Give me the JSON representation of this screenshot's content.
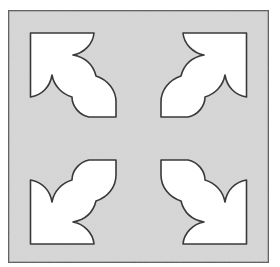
{
  "figure": {
    "colors": {
      "page_background": "#ffffff",
      "tile_fill": "#d8d8d8",
      "tile_border": "#555555",
      "ornament_fill": "#ffffff",
      "ornament_stroke": "#3a3a3a"
    },
    "tile": {
      "x": 8,
      "y": 10,
      "width": 261,
      "height": 253
    },
    "ornaments": [
      {
        "name": "top-left",
        "mirror_x": false,
        "mirror_y": false
      },
      {
        "name": "top-right",
        "mirror_x": true,
        "mirror_y": false
      },
      {
        "name": "bottom-left",
        "mirror_x": false,
        "mirror_y": true
      },
      {
        "name": "bottom-right",
        "mirror_x": true,
        "mirror_y": true
      }
    ],
    "symmetry_center": {
      "x": 138.5,
      "y": 138.5
    }
  }
}
